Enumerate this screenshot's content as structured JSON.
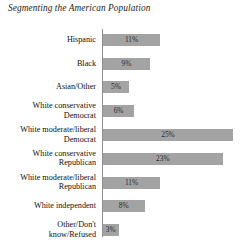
{
  "chart_data": {
    "type": "bar",
    "orientation": "horizontal",
    "title": "Segmenting the American Population",
    "xlabel": "",
    "ylabel": "",
    "grid": false,
    "legend": null,
    "xlim": [
      0,
      25
    ],
    "value_suffix": "%",
    "bar_color": "#a3a3a3",
    "categories": [
      "Hispanic",
      "Black",
      "Asian/Other",
      "White conservative Democrat",
      "White moderate/liberal Democrat",
      "White conservative Republican",
      "White moderate/liberal Republican",
      "White independent",
      "Other/Don't know/Refused"
    ],
    "values": [
      11,
      9,
      5,
      6,
      25,
      23,
      11,
      8,
      3
    ],
    "value_labels": [
      "11%",
      "9%",
      "5%",
      "6%",
      "25%",
      "23%",
      "11%",
      "8%",
      "3%"
    ],
    "category_label_lines": [
      [
        "Hispanic"
      ],
      [
        "Black"
      ],
      [
        "Asian/Other"
      ],
      [
        "White conservative",
        "Democrat"
      ],
      [
        "White moderate/liberal",
        "Democrat"
      ],
      [
        "White conservative",
        "Republican"
      ],
      [
        "White moderate/liberal",
        "Republican"
      ],
      [
        "White independent"
      ],
      [
        "Other/Don't",
        "know/Refused"
      ]
    ]
  }
}
